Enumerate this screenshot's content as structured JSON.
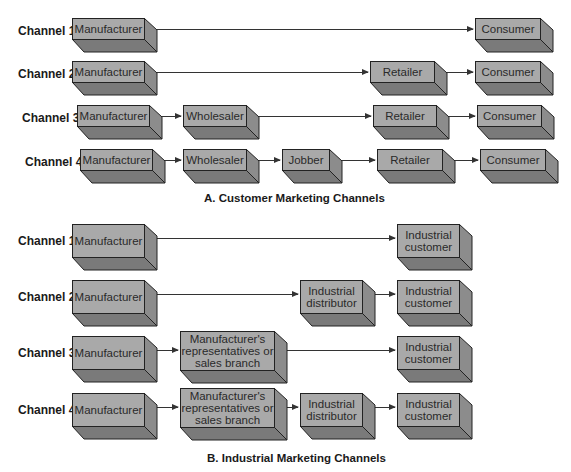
{
  "section_a": {
    "title": "A. Customer Marketing Channels",
    "channels": [
      {
        "label": "Channel 1",
        "nodes": [
          "Manufacturer",
          "Consumer"
        ]
      },
      {
        "label": "Channel 2",
        "nodes": [
          "Manufacturer",
          "Retailer",
          "Consumer"
        ]
      },
      {
        "label": "Channel 3",
        "nodes": [
          "Manufacturer",
          "Wholesaler",
          "Retailer",
          "Consumer"
        ]
      },
      {
        "label": "Channel 4",
        "nodes": [
          "Manufacturer",
          "Wholesaler",
          "Jobber",
          "Retailer",
          "Consumer"
        ]
      }
    ]
  },
  "section_b": {
    "title": "B. Industrial Marketing Channels",
    "channels": [
      {
        "label": "Channel 1",
        "nodes": [
          "Manufacturer",
          "Industrial customer"
        ]
      },
      {
        "label": "Channel 2",
        "nodes": [
          "Manufacturer",
          "Industrial distributor",
          "Industrial customer"
        ]
      },
      {
        "label": "Channel 3",
        "nodes": [
          "Manufacturer",
          "Manufacturer's representatives or sales branch",
          "Industrial customer"
        ]
      },
      {
        "label": "Channel 4",
        "nodes": [
          "Manufacturer",
          "Manufacturer's representatives or sales branch",
          "Industrial distributor",
          "Industrial customer"
        ]
      }
    ]
  },
  "colors": {
    "box_front": "#a9a9a9",
    "box_side": "#8c8c8c",
    "box_bottom": "#7a7a7a",
    "line": "#333333"
  }
}
